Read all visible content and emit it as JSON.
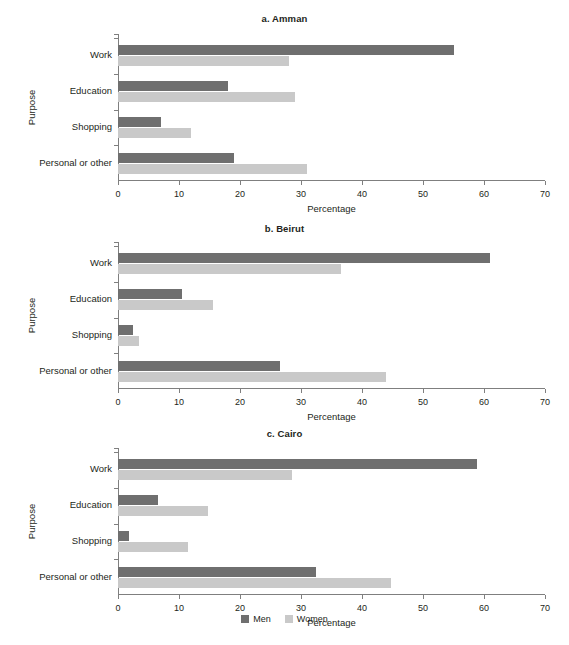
{
  "chart_data": [
    {
      "type": "bar",
      "title": "a. Amman",
      "orientation": "horizontal",
      "xlabel": "Percentage",
      "ylabel": "Purpose",
      "xlim": [
        0,
        70
      ],
      "xticks": [
        0,
        10,
        20,
        30,
        40,
        50,
        60,
        70
      ],
      "grid": false,
      "legend_position": "bottom-center",
      "categories": [
        "Work",
        "Education",
        "Shopping",
        "Personal or other"
      ],
      "series": [
        {
          "name": "Men",
          "color": "#6f6f6f",
          "values": [
            55,
            18,
            7,
            19
          ]
        },
        {
          "name": "Women",
          "color": "#c9c9c9",
          "values": [
            28,
            29,
            12,
            31
          ]
        }
      ]
    },
    {
      "type": "bar",
      "title": "b. Beirut",
      "orientation": "horizontal",
      "xlabel": "Percentage",
      "ylabel": "Purpose",
      "xlim": [
        0,
        70
      ],
      "xticks": [
        0,
        10,
        20,
        30,
        40,
        50,
        60,
        70
      ],
      "grid": false,
      "legend_position": "bottom-center",
      "categories": [
        "Work",
        "Education",
        "Shopping",
        "Personal or other"
      ],
      "series": [
        {
          "name": "Men",
          "color": "#6f6f6f",
          "values": [
            61,
            10.5,
            2.5,
            26.5
          ]
        },
        {
          "name": "Women",
          "color": "#c9c9c9",
          "values": [
            36.5,
            15.5,
            3.5,
            44
          ]
        }
      ]
    },
    {
      "type": "bar",
      "title": "c. Cairo",
      "orientation": "horizontal",
      "xlabel": "Percentage",
      "ylabel": "Purpose",
      "xlim": [
        0,
        70
      ],
      "xticks": [
        0,
        10,
        20,
        30,
        40,
        50,
        60,
        70
      ],
      "grid": false,
      "legend_position": "bottom-center",
      "categories": [
        "Work",
        "Education",
        "Shopping",
        "Personal or other"
      ],
      "series": [
        {
          "name": "Men",
          "color": "#6f6f6f",
          "values": [
            58.8,
            6.5,
            1.8,
            32.4
          ]
        },
        {
          "name": "Women",
          "color": "#c9c9c9",
          "values": [
            28.5,
            14.7,
            11.4,
            44.8
          ]
        }
      ]
    }
  ],
  "legend": {
    "items": [
      {
        "label": "Men",
        "color": "#6f6f6f"
      },
      {
        "label": "Women",
        "color": "#c9c9c9"
      }
    ]
  }
}
